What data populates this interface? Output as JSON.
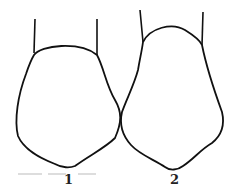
{
  "figure": {
    "labels": [
      "1",
      "2"
    ],
    "stroke_color": "#111111",
    "background": "#ffffff"
  }
}
